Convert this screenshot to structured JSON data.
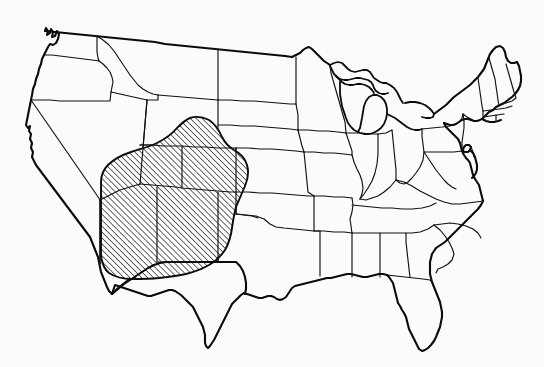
{
  "figure": {
    "kind": "outline-map",
    "title": "Map of the contiguous United States with state boundaries",
    "subject": "United States",
    "projection_note": "conic, continental United States (lower 48)",
    "background_color": "#fbfbf9",
    "line_color": "#0b0b0b"
  },
  "highlight_region": {
    "label": "hatched-region",
    "description": "Diagonally hatched area covering the Four Corners and Southwest states",
    "pattern": "diagonal-hatch",
    "hatch_angle_degrees": 45,
    "hatch_spacing_px": 3,
    "hatch_color": "#0b0b0b",
    "fill_color": "#ffffff",
    "outline_color": "#0b0b0b",
    "covered_states": [
      "Arizona",
      "New Mexico",
      "Utah",
      "Colorado",
      "Nevada (southeast)",
      "Wyoming (south)",
      "Kansas (west)",
      "Oklahoma (panhandle)",
      "Texas (panhandle)"
    ]
  },
  "map_layers": {
    "nation_outline": "nation-outline",
    "state_borders": "state-borders",
    "great_lakes": "great-lakes"
  },
  "geometry": {
    "nation_outline_path": "M 24,163 L 27,156 L 26,147 L 30,141 L 28,133 L 32,127 L 30,118 L 34,112 L 31,104 L 35,97 L 33,89 L 37,82 L 34,74 L 38,68 L 36,60 L 40,54 L 38,46 L 42,40 L 41,34 L 45,30 L 48,36 L 51,31 L 47,26 L 52,22 L 56,27 L 53,33 L 57,38 L 62,35 L 60,42 L 65,40 L 63,47 L 68,45 L 66,52 L 71,50 L 74,44 L 72,38 L 77,36 L 82,39 L 86,34 L 90,38 L 94,34 L 97,39 L 101,36 L 106,40 L 112,37 L 118,40 L 124,38 L 130,41 L 136,39 L 143,42 L 150,40 L 158,43 L 166,41 L 175,44 L 184,42 L 194,44 L 204,43 L 214,45 L 224,44 L 234,46 L 244,45 L 254,47 L 264,46 L 274,48 L 284,47 L 292,49 L 297,46 L 300,51 L 305,49 L 308,53 L 313,51 L 317,56 L 322,54 L 326,59 L 330,57 L 334,62 L 339,60 L 343,65 L 348,63 L 352,68 L 357,66 L 361,71 L 366,69 L 370,74 L 375,72 L 379,77 L 384,75 L 388,80 L 393,78 L 397,83 L 402,81 L 406,86 L 411,84 L 415,89 L 420,87 L 424,92 L 429,90 L 433,95 L 438,93 L 442,98 L 447,96 L 451,101 L 456,99 L 460,104 L 465,102 L 469,107 L 474,105 L 478,110 L 483,108 L 487,113 L 492,111 L 496,116 L 501,114 L 505,119 L 510,117 L 514,122 L 519,120 L 523,125 L 528,123 L 532,128 L 537,126 L 541,131",
    "hatched_region_path": "M 100,181 L 101,172 L 105,165 L 112,159 L 121,154 L 131,150 L 142,147 L 152,144 L 161,140 L 169,135 L 176,129 L 182,123 L 189,119 L 197,117 L 205,118 L 212,122 L 218,128 L 222,135 L 227,140 L 233,143 L 239,147 L 244,153 L 247,161 L 248,170 L 246,179 L 242,187 L 238,195 L 235,203 L 233,212 L 232,221 L 230,230 L 227,239 L 223,247 L 218,254 L 212,260 L 205,265 L 197,269 L 189,272 L 180,275 L 171,277 L 162,278 L 153,279 L 144,280 L 135,280 L 126,279 L 118,277 L 111,274 L 106,269 L 103,263 L 101,256 L 100,248 L 100,239 L 100,230 L 100,221 L 100,212 L 100,203 L 100,194 Z"
  }
}
